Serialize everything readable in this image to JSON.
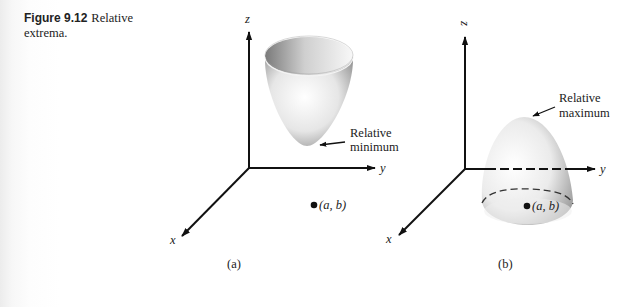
{
  "caption": {
    "figure_number": "Figure 9.12",
    "title": "Relative extrema."
  },
  "panels": [
    {
      "id": "a",
      "label": "(a)",
      "axes": {
        "x": "x",
        "y": "y",
        "z": "z"
      },
      "surface": "paraboloid opening upward (bowl)",
      "annotation": {
        "line1": "Relative",
        "line2": "minimum"
      },
      "point_label": "(a, b)"
    },
    {
      "id": "b",
      "label": "(b)",
      "axes": {
        "x": "x",
        "y": "y",
        "z": "z"
      },
      "surface": "paraboloid opening downward (dome)",
      "annotation": {
        "line1": "Relative",
        "line2": "maximum"
      },
      "point_label": "(a, b)"
    }
  ]
}
